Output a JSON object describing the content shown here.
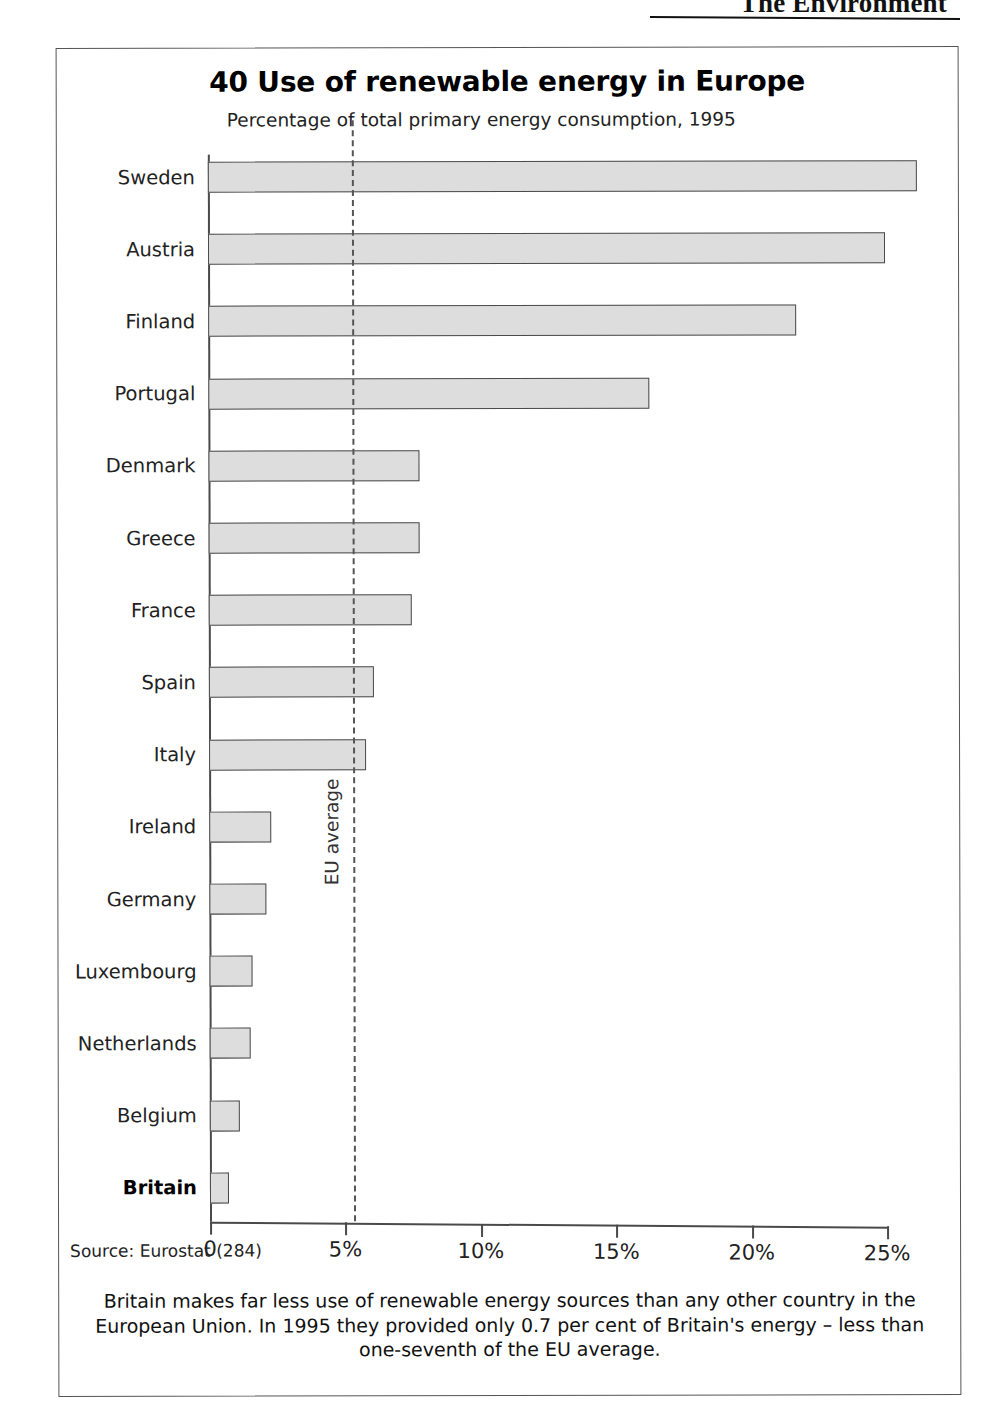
{
  "page_header": {
    "running_head": "The Environment"
  },
  "figure": {
    "number_and_title": "40 Use of renewable energy in Europe",
    "subtitle": "Percentage of total primary energy consumption, 1995",
    "source": "Source: Eurostat (284)",
    "caption": "Britain makes far less use of renewable energy sources than any other country in the European Union. In 1995 they provided only 0.7 per cent of Britain's energy – less than one-seventh of the EU average.",
    "reference_label": "EU average"
  },
  "chart_data": {
    "type": "bar",
    "orientation": "horizontal",
    "title": "40 Use of renewable energy in Europe",
    "subtitle": "Percentage of total primary energy consumption, 1995",
    "xlabel": "",
    "ylabel": "",
    "xlim": [
      0,
      25
    ],
    "grid": false,
    "legend": null,
    "tick_labels": [
      "0",
      "5%",
      "10%",
      "15%",
      "20%",
      "25%"
    ],
    "tick_values": [
      0,
      5,
      10,
      15,
      20,
      25
    ],
    "categories": [
      "Sweden",
      "Austria",
      "Finland",
      "Portugal",
      "Denmark",
      "Greece",
      "France",
      "Spain",
      "Italy",
      "Ireland",
      "Germany",
      "Luxembourg",
      "Netherlands",
      "Belgium",
      "Britain"
    ],
    "values": [
      26.2,
      25.0,
      21.7,
      16.3,
      7.8,
      7.8,
      7.5,
      6.1,
      5.8,
      2.3,
      2.1,
      1.6,
      1.5,
      1.1,
      0.7
    ],
    "highlight_category": "Britain",
    "annotations": [
      {
        "label": "EU average",
        "type": "vline",
        "value": 5.3
      }
    ],
    "bar_fill": "#dddddd",
    "bar_stroke": "#4a4a4a",
    "source": "Source: Eurostat (284)"
  }
}
